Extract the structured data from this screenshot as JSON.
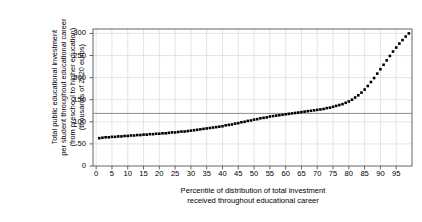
{
  "chart_data": {
    "type": "line",
    "title": "",
    "xlabel_lines": [
      "Percentile of distribution of total investment",
      "received throughout educational career"
    ],
    "ylabel_lines": [
      "Total public educational investment",
      "per student throughout educational career",
      "(from preschool to higher education)",
      "(thousands of 2020 euros)"
    ],
    "xlabel": "Percentile of distribution of total investment received throughout educational career",
    "ylabel": "Total public educational investment per student throughout educational career (from preschool to higher education) (thousands of 2020 euros)",
    "xlim": [
      -1,
      100
    ],
    "ylim": [
      0,
      310
    ],
    "xticks": [
      0,
      5,
      10,
      15,
      20,
      25,
      30,
      35,
      40,
      45,
      50,
      55,
      60,
      65,
      70,
      75,
      80,
      85,
      90,
      95
    ],
    "yticks": [
      0,
      50,
      100,
      150,
      200,
      250,
      300
    ],
    "grid": true,
    "legend": "none",
    "marker": "filled-square",
    "series_color": "#000000",
    "reference_line": {
      "orientation": "horizontal",
      "value": 119,
      "label": "",
      "color": "#808080"
    },
    "x": [
      1,
      2,
      3,
      4,
      5,
      6,
      7,
      8,
      9,
      10,
      11,
      12,
      13,
      14,
      15,
      16,
      17,
      18,
      19,
      20,
      21,
      22,
      23,
      24,
      25,
      26,
      27,
      28,
      29,
      30,
      31,
      32,
      33,
      34,
      35,
      36,
      37,
      38,
      39,
      40,
      41,
      42,
      43,
      44,
      45,
      46,
      47,
      48,
      49,
      50,
      51,
      52,
      53,
      54,
      55,
      56,
      57,
      58,
      59,
      60,
      61,
      62,
      63,
      64,
      65,
      66,
      67,
      68,
      69,
      70,
      71,
      72,
      73,
      74,
      75,
      76,
      77,
      78,
      79,
      80,
      81,
      82,
      83,
      84,
      85,
      86,
      87,
      88,
      89,
      90,
      91,
      92,
      93,
      94,
      95,
      96,
      97,
      98,
      99
    ],
    "values": [
      63,
      64,
      65,
      65,
      66,
      66,
      67,
      67,
      68,
      68,
      69,
      69,
      70,
      70,
      71,
      71,
      72,
      72,
      73,
      73,
      74,
      74,
      75,
      76,
      76,
      77,
      78,
      78,
      79,
      80,
      81,
      82,
      83,
      84,
      85,
      86,
      87,
      88,
      89,
      90,
      92,
      93,
      94,
      96,
      97,
      99,
      100,
      102,
      103,
      105,
      106,
      108,
      109,
      110,
      112,
      113,
      114,
      115,
      116,
      117,
      118,
      119,
      120,
      121,
      122,
      123,
      124,
      125,
      126,
      127,
      128,
      129,
      131,
      132,
      134,
      136,
      138,
      140,
      143,
      146,
      150,
      155,
      160,
      166,
      173,
      181,
      190,
      199,
      209,
      219,
      229,
      239,
      249,
      259,
      268,
      277,
      285,
      293,
      300
    ],
    "y_axis_unit": "thousands of 2020 euros",
    "x_axis_unit": "percentile"
  },
  "axis": {
    "ytick_labels": [
      "300",
      "250",
      "200",
      "150",
      "100",
      "50",
      "0"
    ],
    "xtick_labels": [
      "0",
      "5",
      "10",
      "15",
      "20",
      "25",
      "30",
      "35",
      "40",
      "45",
      "50",
      "55",
      "60",
      "65",
      "70",
      "75",
      "80",
      "85",
      "90",
      "95"
    ]
  },
  "style": {
    "background": "#ffffff",
    "axis_color": "#555555",
    "grid_color": "#d8d8d8",
    "series_color": "#000000",
    "reference_color": "#808080"
  }
}
